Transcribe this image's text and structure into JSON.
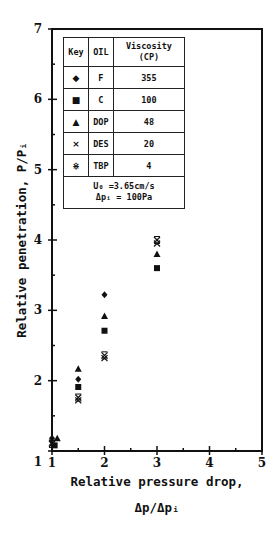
{
  "chart_data": {
    "type": "scatter",
    "title": "",
    "xlabel": "Relative pressure drop, Δp/Δpi",
    "ylabel": "Relative penetration, P/Pi",
    "xlim": [
      1,
      5
    ],
    "ylim": [
      1,
      7
    ],
    "x_ticks": [
      "1",
      "2",
      "3",
      "4",
      "5"
    ],
    "y_ticks": [
      "1",
      "2",
      "3",
      "4",
      "5",
      "6",
      "7"
    ],
    "grid": false,
    "legend_position": "upper-left (inset table)",
    "series": [
      {
        "name": "F",
        "marker": "diamond",
        "viscosity_cp": 355,
        "x": [
          1.0,
          1.5,
          2.0
        ],
        "y": [
          1.18,
          2.02,
          3.22
        ]
      },
      {
        "name": "C",
        "marker": "square",
        "viscosity_cp": 100,
        "x": [
          1.05,
          1.5,
          2.0,
          3.0
        ],
        "y": [
          1.08,
          1.91,
          2.71,
          3.6
        ]
      },
      {
        "name": "DOP",
        "marker": "triangle",
        "viscosity_cp": 48,
        "x": [
          1.1,
          1.5,
          2.0,
          3.0
        ],
        "y": [
          1.18,
          2.17,
          2.92,
          3.8
        ]
      },
      {
        "name": "DES",
        "marker": "x",
        "viscosity_cp": 20,
        "x": [
          1.0,
          1.5,
          2.0,
          3.0
        ],
        "y": [
          1.12,
          1.72,
          2.32,
          3.95
        ]
      },
      {
        "name": "TBP",
        "marker": "asterisk",
        "viscosity_cp": 4,
        "x": [
          1.0,
          1.5,
          2.0,
          3.0
        ],
        "y": [
          1.1,
          1.76,
          2.36,
          4.0
        ]
      }
    ],
    "annotations": [
      "U0 =3.65cm/s",
      "Δpi = 100Pa"
    ]
  },
  "legend": {
    "headers": [
      "Key",
      "OIL",
      "Viscosity",
      "(CP)"
    ],
    "rows": [
      {
        "key": "◆",
        "oil": "F",
        "viscosity": "355"
      },
      {
        "key": "■",
        "oil": "C",
        "viscosity": "100"
      },
      {
        "key": "▲",
        "oil": "DOP",
        "viscosity": "48"
      },
      {
        "key": "×",
        "oil": "DES",
        "viscosity": "20"
      },
      {
        "key": "⋇",
        "oil": "TBP",
        "viscosity": "4"
      }
    ],
    "note_line1": "U₀ =3.65cm/s",
    "note_line2": "Δpᵢ = 100Pa"
  },
  "axes": {
    "ylabel_text": "Relative penetration, P/Pᵢ",
    "xlabel_line1": "Relative pressure drop,",
    "xlabel_line2": "Δp/Δpᵢ",
    "corner_label": "1"
  }
}
